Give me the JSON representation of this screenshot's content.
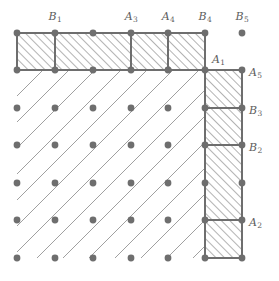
{
  "figure": {
    "geometry": {
      "width": 279,
      "height": 281,
      "dot_xs": [
        17,
        55,
        93,
        131,
        168,
        205,
        242
      ],
      "dot_ys": [
        33,
        70,
        108,
        145,
        183,
        220,
        258
      ],
      "dot_radius": 3.4,
      "top_strip": {
        "x0": 17,
        "x1": 205,
        "y0": 33,
        "y1": 70,
        "dividers_x": [
          55,
          131,
          168
        ]
      },
      "right_strip": {
        "x0": 205,
        "x1": 242,
        "y0": 70,
        "y1": 258,
        "dividers_y": [
          108,
          145,
          220
        ]
      },
      "interior": {
        "x0": 17,
        "x1": 205,
        "y0": 70,
        "y1": 258
      },
      "diagonal_angle_deg": 45,
      "diagonal_spacing": 26
    },
    "colors": {
      "dot": "#6e6e6e",
      "line": "#6e6e6e",
      "hatch": "#9a9a9a",
      "diagonal": "#a0a0a0",
      "label": "#5d5d5d",
      "background": "#ffffff"
    },
    "labels": [
      {
        "id": "B1",
        "base": "B",
        "sub": "1",
        "x": 55,
        "y": 17,
        "anchor": "middle",
        "group": "top"
      },
      {
        "id": "A3",
        "base": "A",
        "sub": "3",
        "x": 131,
        "y": 17,
        "anchor": "middle",
        "group": "top"
      },
      {
        "id": "A4",
        "base": "A",
        "sub": "4",
        "x": 168,
        "y": 17,
        "anchor": "middle",
        "group": "top"
      },
      {
        "id": "B4",
        "base": "B",
        "sub": "4",
        "x": 205,
        "y": 17,
        "anchor": "middle",
        "group": "top"
      },
      {
        "id": "B5",
        "base": "B",
        "sub": "5",
        "x": 242,
        "y": 17,
        "anchor": "middle",
        "group": "top"
      },
      {
        "id": "A1",
        "base": "A",
        "sub": "1",
        "x": 212,
        "y": 60,
        "anchor": "start",
        "group": "inner"
      },
      {
        "id": "A5",
        "base": "A",
        "sub": "5",
        "x": 249,
        "y": 73,
        "anchor": "start",
        "group": "right"
      },
      {
        "id": "B3",
        "base": "B",
        "sub": "3",
        "x": 249,
        "y": 111,
        "anchor": "start",
        "group": "right"
      },
      {
        "id": "B2",
        "base": "B",
        "sub": "2",
        "x": 249,
        "y": 148,
        "anchor": "start",
        "group": "right"
      },
      {
        "id": "A2",
        "base": "A",
        "sub": "2",
        "x": 249,
        "y": 223,
        "anchor": "start",
        "group": "right"
      }
    ]
  }
}
